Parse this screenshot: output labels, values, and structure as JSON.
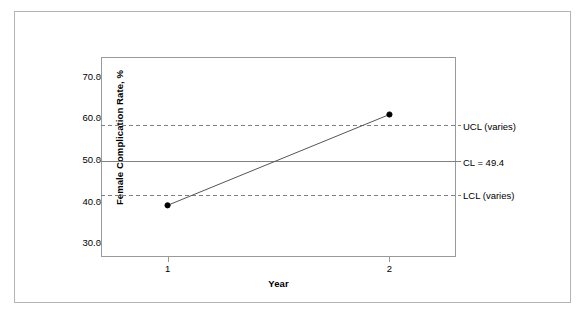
{
  "chart_data": {
    "type": "line",
    "title": "",
    "subtitle": "",
    "xlabel": "Year",
    "ylabel": "Female Complication Rate, %",
    "x": [
      1,
      2
    ],
    "categories": [
      "1",
      "2"
    ],
    "values": [
      38.9,
      60.7
    ],
    "series": [
      {
        "name": "Female Complication Rate",
        "values": [
          38.9,
          60.7
        ],
        "marker": "filled-circle",
        "color": "#000000"
      }
    ],
    "xlim": [
      0.7,
      2.3
    ],
    "ylim": [
      26.5,
      74.5
    ],
    "xticks": [
      1,
      2
    ],
    "xticklabels": [
      "1",
      "2"
    ],
    "yticks": [
      30.0,
      40.0,
      50.0,
      60.0,
      70.0
    ],
    "yticklabels": [
      "30.0",
      "40.0",
      "50.0",
      "60.0",
      "70.0"
    ],
    "grid": false,
    "legend": "none",
    "control_limits": [
      {
        "id": "ucl",
        "label": "UCL (varies)",
        "value": 58.0,
        "style": "dashed",
        "color": "#808080"
      },
      {
        "id": "cl",
        "label": "CL = 49.4",
        "value": 49.4,
        "style": "solid",
        "color": "#808080"
      },
      {
        "id": "lcl",
        "label": "LCL (varies)",
        "value": 41.3,
        "style": "dashed",
        "color": "#808080"
      }
    ],
    "annotations": [
      {
        "name": "ucl-label",
        "text": "UCL (varies)"
      },
      {
        "name": "cl-label",
        "text": "CL = 49.4"
      },
      {
        "name": "lcl-label",
        "text": "LCL (varies)"
      }
    ]
  },
  "axes": {
    "y_title": "Female Complication Rate, %",
    "x_title": "Year",
    "y_ticks": [
      "70.0",
      "60.0",
      "50.0",
      "40.0",
      "30.0"
    ],
    "x_ticks": [
      "1",
      "2"
    ]
  },
  "limits": {
    "ucl_label": "UCL (varies)",
    "cl_label": "CL = 49.4",
    "lcl_label": "LCL (varies)"
  },
  "colors": {
    "frame": "#b4b4b4",
    "plot_border": "#9a9a9a",
    "limit_line": "#808080",
    "data_line": "#555555",
    "marker": "#000000",
    "text": "#000000",
    "background": "#ffffff"
  }
}
